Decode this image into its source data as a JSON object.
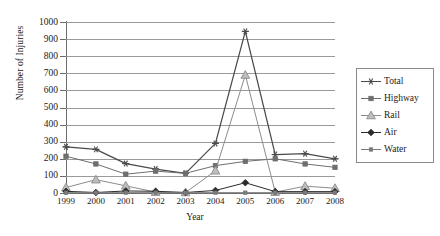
{
  "chart_data": {
    "type": "line",
    "title": "",
    "xlabel": "Year",
    "ylabel": "Number of Injuries",
    "categories": [
      "1999",
      "2000",
      "2001",
      "2002",
      "2003",
      "2004",
      "2005",
      "2006",
      "2007",
      "2008"
    ],
    "ylim": [
      0,
      1000
    ],
    "ytick_step": 100,
    "yticks": [
      "0",
      "100",
      "200",
      "300",
      "400",
      "500",
      "600",
      "700",
      "800",
      "900",
      "1000"
    ],
    "grid": "horizontal",
    "legend_position": "right",
    "series": [
      {
        "name": "Total",
        "marker": "asterisk",
        "color": "#4a4a4a",
        "values": [
          270,
          255,
          172,
          140,
          115,
          290,
          945,
          225,
          230,
          200
        ]
      },
      {
        "name": "Highway",
        "marker": "square",
        "color": "#6e6e6e",
        "values": [
          215,
          170,
          110,
          128,
          115,
          160,
          185,
          200,
          170,
          150
        ]
      },
      {
        "name": "Rail",
        "marker": "triangle",
        "color": "#8c8c8c",
        "values": [
          32,
          78,
          42,
          5,
          3,
          130,
          690,
          5,
          40,
          28
        ]
      },
      {
        "name": "Air",
        "marker": "diamond-filled",
        "color": "#2b2b2b",
        "values": [
          10,
          3,
          12,
          10,
          3,
          15,
          60,
          8,
          8,
          8
        ]
      },
      {
        "name": "Water",
        "marker": "small-square",
        "color": "#7a7a7a",
        "values": [
          2,
          2,
          2,
          2,
          2,
          2,
          2,
          2,
          2,
          2
        ]
      }
    ]
  },
  "legend": {
    "items": [
      {
        "label": "Total"
      },
      {
        "label": "Highway"
      },
      {
        "label": "Rail"
      },
      {
        "label": "Air"
      },
      {
        "label": "Water"
      }
    ]
  }
}
